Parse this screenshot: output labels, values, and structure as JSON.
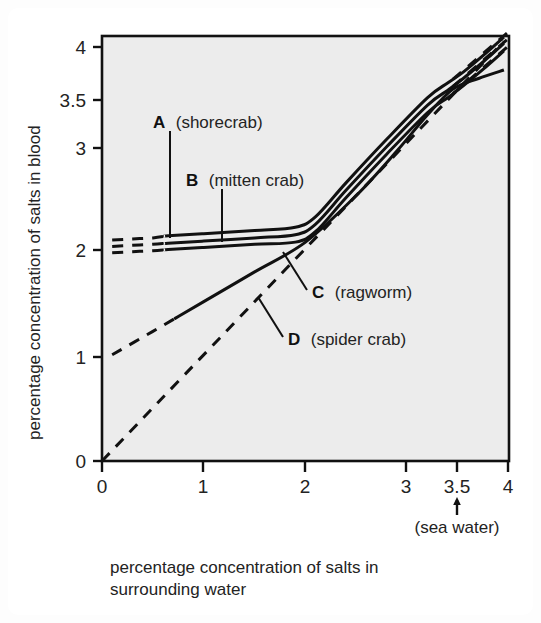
{
  "figure": {
    "background_color": "#ffffff",
    "plot_background_color": "#ececec",
    "line_color": "#111111"
  },
  "chart_data": {
    "type": "line",
    "title": "",
    "xlabel_line1": "percentage concentration of salts in",
    "xlabel_line2": "surrounding water",
    "ylabel": "percentage concentration of salts in blood",
    "xlim": [
      0,
      4
    ],
    "ylim": [
      0,
      4
    ],
    "grid": false,
    "legend_position": "inline-annotations",
    "xticks": [
      0,
      1,
      2,
      3,
      3.5,
      4
    ],
    "xticklabels": [
      "0",
      "1",
      "2",
      "3",
      "3.5",
      "4"
    ],
    "yticks": [
      0,
      1,
      2,
      3,
      3.5,
      4
    ],
    "yticklabels": [
      "0",
      "1",
      "2",
      "3",
      "3.5",
      "4"
    ],
    "annotations": [
      {
        "text": "(sea water)",
        "x": 3.5,
        "y": -0.45,
        "arrow": "up",
        "arrow_target_x": 3.5
      }
    ],
    "series": [
      {
        "name": "A (shorecrab)",
        "letter": "A",
        "label": "(shorecrab)",
        "style": "solid-with-dashed-extrapolation",
        "points": [
          [
            0.1,
            2.08
          ],
          [
            0.3,
            2.09
          ],
          [
            0.5,
            2.1
          ],
          [
            0.65,
            2.12
          ],
          [
            1.0,
            2.14
          ],
          [
            1.5,
            2.17
          ],
          [
            1.9,
            2.2
          ],
          [
            2.1,
            2.3
          ],
          [
            2.4,
            2.62
          ],
          [
            2.8,
            3.03
          ],
          [
            3.2,
            3.42
          ],
          [
            3.4,
            3.56
          ],
          [
            3.55,
            3.66
          ],
          [
            3.75,
            3.82
          ],
          [
            3.95,
            3.99
          ]
        ],
        "dashed_from_x": 0.1,
        "dashed_to_x": 0.62,
        "dashed_tail_from_x": 3.45
      },
      {
        "name": "B (mitten crab)",
        "letter": "B",
        "label": "(mitten crab)",
        "style": "solid-with-dashed-extrapolation",
        "points": [
          [
            0.1,
            2.02
          ],
          [
            0.3,
            2.03
          ],
          [
            0.5,
            2.04
          ],
          [
            0.65,
            2.05
          ],
          [
            1.0,
            2.07
          ],
          [
            1.5,
            2.1
          ],
          [
            1.9,
            2.13
          ],
          [
            2.1,
            2.23
          ],
          [
            2.4,
            2.55
          ],
          [
            2.8,
            2.96
          ],
          [
            3.2,
            3.35
          ],
          [
            3.4,
            3.49
          ],
          [
            3.55,
            3.6
          ],
          [
            3.75,
            3.76
          ],
          [
            3.95,
            3.93
          ]
        ],
        "dashed_from_x": 0.1,
        "dashed_to_x": 0.62,
        "dashed_tail_from_x": 3.45
      },
      {
        "name": "C (ragworm)",
        "letter": "C",
        "label": "(ragworm)",
        "style": "solid-with-dashed-extrapolation",
        "points": [
          [
            0.1,
            1.96
          ],
          [
            0.3,
            1.97
          ],
          [
            0.5,
            1.98
          ],
          [
            0.65,
            1.99
          ],
          [
            1.0,
            2.01
          ],
          [
            1.5,
            2.04
          ],
          [
            1.9,
            2.06
          ],
          [
            2.1,
            2.16
          ],
          [
            2.4,
            2.48
          ],
          [
            2.8,
            2.89
          ],
          [
            3.2,
            3.28
          ],
          [
            3.4,
            3.42
          ],
          [
            3.55,
            3.53
          ],
          [
            3.75,
            3.69
          ],
          [
            3.95,
            3.86
          ]
        ],
        "dashed_from_x": 0.1,
        "dashed_to_x": 0.62,
        "dashed_tail_from_x": 3.45
      },
      {
        "name": "D (spider crab)",
        "letter": "D",
        "label": "(spider crab)",
        "style": "solid-with-dashed-extrapolation-low",
        "points": [
          [
            0.1,
            1.0
          ],
          [
            0.5,
            1.22
          ],
          [
            0.75,
            1.36
          ],
          [
            1.0,
            1.5
          ],
          [
            1.5,
            1.78
          ],
          [
            2.0,
            2.06
          ],
          [
            2.5,
            2.5
          ],
          [
            2.9,
            2.92
          ],
          [
            3.2,
            3.26
          ],
          [
            3.45,
            3.5
          ],
          [
            3.7,
            3.6
          ],
          [
            3.95,
            3.68
          ]
        ],
        "dashed_from_x": 0.1,
        "dashed_to_x": 0.72
      },
      {
        "name": "isosmotic line",
        "letter": "",
        "label": "",
        "style": "dashed",
        "points": [
          [
            0.0,
            0.0
          ],
          [
            3.95,
            3.95
          ]
        ]
      }
    ]
  },
  "labels": {
    "a_letter": "A",
    "a_name": "(shorecrab)",
    "b_letter": "B",
    "b_name": "(mitten crab)",
    "c_letter": "C",
    "c_name": "(ragworm)",
    "d_letter": "D",
    "d_name": "(spider crab)",
    "sea_water": "(sea water)"
  },
  "axes": {
    "x_tick_0": "0",
    "x_tick_1": "1",
    "x_tick_2": "2",
    "x_tick_3": "3",
    "x_tick_35": "3.5",
    "x_tick_4": "4",
    "y_tick_0": "0",
    "y_tick_1": "1",
    "y_tick_2": "2",
    "y_tick_3": "3",
    "y_tick_35": "3.5",
    "y_tick_4": "4",
    "x_title_line1": "percentage concentration of salts in",
    "x_title_line2": "surrounding water",
    "y_title": "percentage concentration of salts in blood"
  }
}
